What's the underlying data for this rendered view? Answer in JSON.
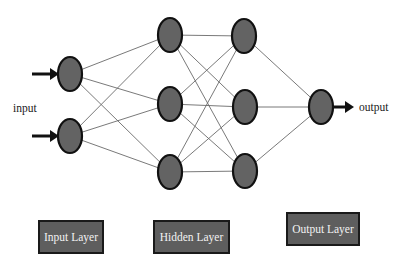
{
  "diagram": {
    "labels": {
      "input": "input",
      "output": "output"
    },
    "layers": [
      {
        "name": "Input Layer",
        "nodes": 2
      },
      {
        "name": "Hidden Layer",
        "nodes": 6,
        "sublayers": [
          3,
          3
        ]
      },
      {
        "name": "Output Layer",
        "nodes": 1
      }
    ],
    "layer_boxes": {
      "input": "Input Layer",
      "hidden": "Hidden Layer",
      "output": "Output Layer"
    },
    "colors": {
      "node_fill": "#636363",
      "node_stroke": "#111111",
      "edge": "#6a6a6a",
      "box_fill": "#5e5e5e",
      "box_text": "#f2f2f2"
    }
  }
}
